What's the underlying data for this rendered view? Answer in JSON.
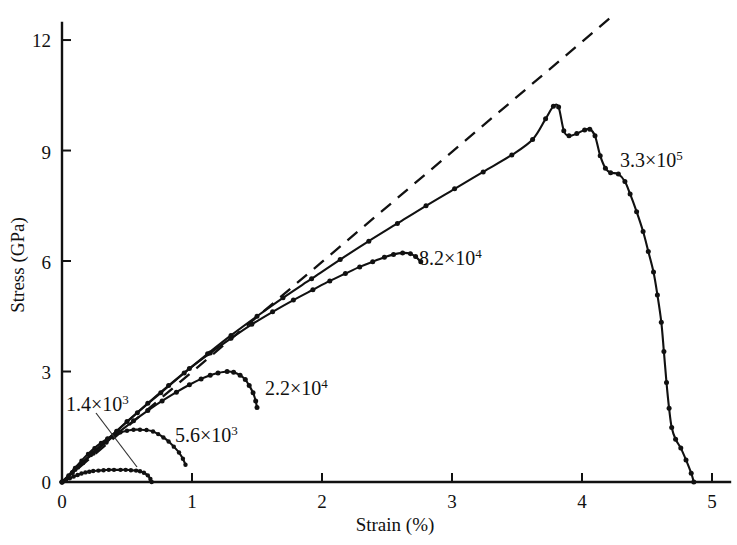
{
  "figure": {
    "background_color": "#ffffff",
    "ink_color": "#111111"
  },
  "axes": {
    "x_title": "Strain (%)",
    "y_title": "Stress (GPa)",
    "x_ticks": [
      "0",
      "1",
      "2",
      "3",
      "4",
      "5"
    ],
    "y_ticks": [
      "0",
      "3",
      "6",
      "9",
      "12"
    ]
  },
  "labels": {
    "s1_mantissa": "1.4×10",
    "s1_exp": "3",
    "s2_mantissa": "5.6×10",
    "s2_exp": "3",
    "s3_mantissa": "2.2×10",
    "s3_exp": "4",
    "s4_mantissa": "8.2×10",
    "s4_exp": "4",
    "s5_mantissa": "3.3×10",
    "s5_exp": "5"
  },
  "chart_data": {
    "type": "line",
    "title": "",
    "xlabel": "Strain (%)",
    "ylabel": "Stress (GPa)",
    "xlim": [
      0,
      5.05
    ],
    "ylim": [
      0,
      12.8
    ],
    "xticks": [
      0,
      1,
      2,
      3,
      4,
      5
    ],
    "yticks": [
      0,
      3,
      6,
      9,
      12
    ],
    "grid": false,
    "legend": "inline-annotations",
    "markers": "filled-circles",
    "series": [
      {
        "name": "1.4×10³",
        "label": "1.4×10^3",
        "style": "solid",
        "peak_strain": 0.45,
        "peak_stress": 0.33,
        "end_strain": 0.69,
        "points": [
          [
            0.0,
            0.0
          ],
          [
            0.03,
            0.05
          ],
          [
            0.06,
            0.1
          ],
          [
            0.09,
            0.15
          ],
          [
            0.12,
            0.19
          ],
          [
            0.15,
            0.23
          ],
          [
            0.18,
            0.26
          ],
          [
            0.21,
            0.28
          ],
          [
            0.24,
            0.3
          ],
          [
            0.28,
            0.31
          ],
          [
            0.32,
            0.32
          ],
          [
            0.36,
            0.33
          ],
          [
            0.4,
            0.33
          ],
          [
            0.45,
            0.33
          ],
          [
            0.49,
            0.33
          ],
          [
            0.53,
            0.32
          ],
          [
            0.57,
            0.31
          ],
          [
            0.6,
            0.29
          ],
          [
            0.63,
            0.25
          ],
          [
            0.66,
            0.18
          ],
          [
            0.68,
            0.08
          ],
          [
            0.69,
            0.0
          ]
        ]
      },
      {
        "name": "5.6×10³",
        "label": "5.6×10^3",
        "style": "solid",
        "peak_strain": 0.62,
        "peak_stress": 1.42,
        "end_strain": 0.95,
        "points": [
          [
            0.0,
            0.0
          ],
          [
            0.05,
            0.18
          ],
          [
            0.1,
            0.38
          ],
          [
            0.15,
            0.58
          ],
          [
            0.2,
            0.76
          ],
          [
            0.25,
            0.92
          ],
          [
            0.3,
            1.06
          ],
          [
            0.35,
            1.18
          ],
          [
            0.4,
            1.28
          ],
          [
            0.45,
            1.35
          ],
          [
            0.5,
            1.39
          ],
          [
            0.55,
            1.42
          ],
          [
            0.6,
            1.42
          ],
          [
            0.65,
            1.41
          ],
          [
            0.7,
            1.37
          ],
          [
            0.74,
            1.3
          ],
          [
            0.78,
            1.21
          ],
          [
            0.82,
            1.1
          ],
          [
            0.86,
            0.96
          ],
          [
            0.9,
            0.8
          ],
          [
            0.93,
            0.63
          ],
          [
            0.95,
            0.47
          ]
        ]
      },
      {
        "name": "2.2×10⁴",
        "label": "2.2×10^4",
        "style": "solid",
        "peak_strain": 1.27,
        "peak_stress": 3.0,
        "end_strain": 1.5,
        "points": [
          [
            0.0,
            0.0
          ],
          [
            0.08,
            0.26
          ],
          [
            0.16,
            0.52
          ],
          [
            0.24,
            0.78
          ],
          [
            0.34,
            1.08
          ],
          [
            0.44,
            1.36
          ],
          [
            0.55,
            1.66
          ],
          [
            0.66,
            1.94
          ],
          [
            0.77,
            2.2
          ],
          [
            0.88,
            2.44
          ],
          [
            0.98,
            2.64
          ],
          [
            1.07,
            2.8
          ],
          [
            1.14,
            2.9
          ],
          [
            1.2,
            2.96
          ],
          [
            1.27,
            3.0
          ],
          [
            1.32,
            2.98
          ],
          [
            1.37,
            2.9
          ],
          [
            1.41,
            2.78
          ],
          [
            1.44,
            2.62
          ],
          [
            1.47,
            2.42
          ],
          [
            1.49,
            2.2
          ],
          [
            1.5,
            2.02
          ]
        ]
      },
      {
        "name": "8.2×10⁴",
        "label": "8.2×10^4",
        "style": "solid",
        "peak_strain": 2.6,
        "peak_stress": 6.22,
        "end_strain": 2.76,
        "points": [
          [
            0.0,
            0.0
          ],
          [
            0.1,
            0.34
          ],
          [
            0.22,
            0.74
          ],
          [
            0.35,
            1.16
          ],
          [
            0.5,
            1.64
          ],
          [
            0.66,
            2.14
          ],
          [
            0.82,
            2.62
          ],
          [
            0.98,
            3.08
          ],
          [
            1.14,
            3.5
          ],
          [
            1.3,
            3.9
          ],
          [
            1.46,
            4.28
          ],
          [
            1.62,
            4.62
          ],
          [
            1.78,
            4.94
          ],
          [
            1.93,
            5.22
          ],
          [
            2.06,
            5.46
          ],
          [
            2.18,
            5.66
          ],
          [
            2.29,
            5.84
          ],
          [
            2.39,
            5.98
          ],
          [
            2.48,
            6.1
          ],
          [
            2.55,
            6.18
          ],
          [
            2.62,
            6.22
          ],
          [
            2.68,
            6.2
          ],
          [
            2.72,
            6.12
          ],
          [
            2.76,
            5.98
          ]
        ]
      },
      {
        "name": "3.3×10⁵",
        "label": "3.3×10^5",
        "style": "solid",
        "peak_strain": 3.78,
        "peak_stress": 10.2,
        "end_strain": 4.86,
        "points": [
          [
            0.0,
            0.0
          ],
          [
            0.12,
            0.4
          ],
          [
            0.26,
            0.86
          ],
          [
            0.42,
            1.38
          ],
          [
            0.58,
            1.88
          ],
          [
            0.76,
            2.42
          ],
          [
            0.94,
            2.96
          ],
          [
            1.12,
            3.48
          ],
          [
            1.3,
            3.98
          ],
          [
            1.5,
            4.5
          ],
          [
            1.7,
            5.0
          ],
          [
            1.92,
            5.52
          ],
          [
            2.14,
            6.04
          ],
          [
            2.36,
            6.54
          ],
          [
            2.58,
            7.02
          ],
          [
            2.8,
            7.5
          ],
          [
            3.02,
            7.96
          ],
          [
            3.24,
            8.42
          ],
          [
            3.46,
            8.88
          ],
          [
            3.62,
            9.3
          ],
          [
            3.72,
            9.86
          ],
          [
            3.78,
            10.2
          ],
          [
            3.82,
            10.18
          ],
          [
            3.86,
            9.54
          ],
          [
            3.9,
            9.4
          ],
          [
            3.96,
            9.46
          ],
          [
            4.02,
            9.56
          ],
          [
            4.06,
            9.58
          ],
          [
            4.1,
            9.4
          ],
          [
            4.14,
            8.86
          ],
          [
            4.18,
            8.52
          ],
          [
            4.22,
            8.4
          ],
          [
            4.28,
            8.36
          ],
          [
            4.33,
            8.16
          ],
          [
            4.37,
            7.82
          ],
          [
            4.42,
            7.34
          ],
          [
            4.47,
            6.8
          ],
          [
            4.51,
            6.26
          ],
          [
            4.55,
            5.7
          ],
          [
            4.58,
            5.08
          ],
          [
            4.61,
            4.34
          ],
          [
            4.63,
            3.54
          ],
          [
            4.65,
            2.7
          ],
          [
            4.67,
            2.0
          ],
          [
            4.69,
            1.48
          ],
          [
            4.72,
            1.16
          ],
          [
            4.76,
            0.92
          ],
          [
            4.8,
            0.6
          ],
          [
            4.84,
            0.24
          ],
          [
            4.86,
            0.0
          ]
        ]
      },
      {
        "name": "linear-elastic-reference",
        "label": "",
        "style": "dashed",
        "points": [
          [
            0.0,
            0.0
          ],
          [
            4.25,
            12.7
          ]
        ]
      }
    ]
  }
}
